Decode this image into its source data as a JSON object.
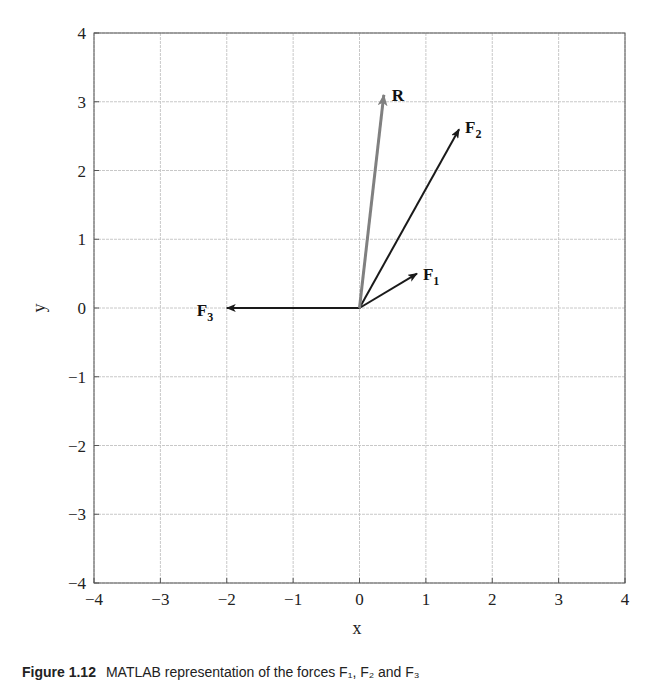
{
  "chart_data": {
    "type": "line",
    "subtype": "vector-plot",
    "title": "",
    "xlabel": "x",
    "ylabel": "y",
    "xlim": [
      -4,
      4
    ],
    "ylim": [
      -4,
      4
    ],
    "grid": true,
    "xticks": [
      "-4",
      "-3",
      "-2",
      "-1",
      "0",
      "1",
      "2",
      "3",
      "4"
    ],
    "yticks": [
      "4",
      "3",
      "2",
      "1",
      "0",
      "-1",
      "-2",
      "-3",
      "-4"
    ],
    "vectors": [
      {
        "name": "F1",
        "label": "F",
        "sub": "1",
        "from": [
          0,
          0
        ],
        "to": [
          0.866,
          0.5
        ],
        "color": "#1a1a1a"
      },
      {
        "name": "F2",
        "label": "F",
        "sub": "2",
        "from": [
          0,
          0
        ],
        "to": [
          1.5,
          2.6
        ],
        "color": "#1a1a1a"
      },
      {
        "name": "F3",
        "label": "F",
        "sub": "3",
        "from": [
          0,
          0
        ],
        "to": [
          -2.0,
          0
        ],
        "color": "#1a1a1a"
      },
      {
        "name": "R",
        "label": "R",
        "sub": "",
        "from": [
          0,
          0
        ],
        "to": [
          0.366,
          3.1
        ],
        "color": "#808080"
      }
    ],
    "legend": null
  },
  "caption": {
    "figure_number": "Figure 1.12",
    "text": "MATLAB representation of the forces F₁, F₂ and F₃"
  }
}
